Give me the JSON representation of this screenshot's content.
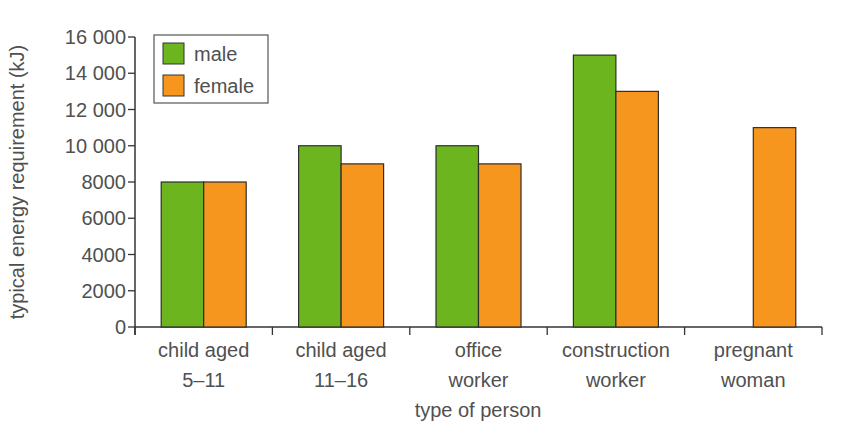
{
  "chart_data": {
    "type": "bar",
    "title": "",
    "xlabel": "type of person",
    "ylabel": "typical energy requirement (kJ)",
    "ylim": [
      0,
      16000
    ],
    "yticks": [
      0,
      2000,
      4000,
      6000,
      8000,
      10000,
      12000,
      14000,
      16000
    ],
    "ytick_labels": [
      "0",
      "2000",
      "4000",
      "6000",
      "8000",
      "10 000",
      "12 000",
      "14 000",
      "16 000"
    ],
    "categories": [
      [
        "child aged",
        "5–11"
      ],
      [
        "child aged",
        "11–16"
      ],
      [
        "office",
        "worker"
      ],
      [
        "construction",
        "worker"
      ],
      [
        "pregnant",
        "woman"
      ]
    ],
    "series": [
      {
        "name": "male",
        "color": "#6cb51e",
        "values": [
          8000,
          10000,
          10000,
          15000,
          null
        ]
      },
      {
        "name": "female",
        "color": "#f7961e",
        "values": [
          8000,
          9000,
          9000,
          13000,
          11000
        ]
      }
    ],
    "grid": false,
    "legend_position": "upper-left-inside"
  },
  "legend": {
    "items": [
      {
        "label": "male",
        "color": "#6cb51e"
      },
      {
        "label": "female",
        "color": "#f7961e"
      }
    ]
  },
  "axes": {
    "x_title": "type of person",
    "y_title": "typical energy requirement (kJ)"
  }
}
